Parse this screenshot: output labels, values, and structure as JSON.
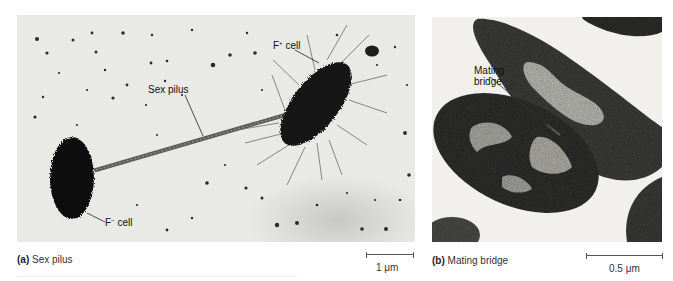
{
  "figure": {
    "panel_a": {
      "letter": "(a)",
      "title": "Sex pilus",
      "labels": {
        "f_plus_cell": {
          "base": "F",
          "sup": "+",
          "rest": " cell"
        },
        "f_minus_cell": {
          "base": "F",
          "sup": "−",
          "rest": " cell"
        },
        "sex_pilus": "Sex pilus"
      },
      "scale_bar": "1 μm"
    },
    "panel_b": {
      "letter": "(b)",
      "title": "Mating bridge",
      "labels": {
        "mating_bridge_line1": "Mating",
        "mating_bridge_line2": "bridge"
      },
      "scale_bar": "0.5 μm"
    }
  },
  "colors": {
    "background": "#ffffff",
    "micrograph_bg": "#e9e9e6",
    "cell_dark": "#141414",
    "cell_medium": "#3a3a3a",
    "nucleoid_light": "#bdbdb6"
  }
}
